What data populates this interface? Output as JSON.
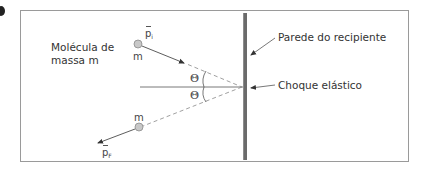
{
  "figure": {
    "marker": "bullet",
    "molecule_label": {
      "line1": "Molécula de",
      "line2": "massa m"
    },
    "wall_label": "Parede do recipiente",
    "collision_label": "Choque elástico",
    "initial_molecule": {
      "mass_label": "m",
      "momentum_symbol": "p",
      "momentum_subscript": "i"
    },
    "final_molecule": {
      "mass_label": "m",
      "momentum_symbol": "p",
      "momentum_subscript": "F"
    },
    "angle_top": "Θ",
    "angle_bottom": "Θ",
    "colors": {
      "wall": "#6b6b6b",
      "frame": "#9a9a9a",
      "line": "#555555",
      "dashed": "#888888",
      "molecule_fill": "#c8c8c8",
      "molecule_stroke": "#8a8a8a",
      "text": "#333333"
    }
  }
}
